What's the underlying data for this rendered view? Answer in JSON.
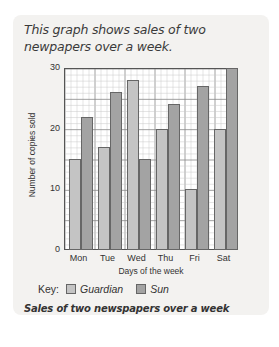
{
  "intro_text": "This graph shows sales of two newpapers over a week.",
  "caption": "Sales of two newspapers over a week",
  "key": {
    "label": "Key:",
    "items": [
      {
        "name": "Guardian",
        "color": "#c4c4c4"
      },
      {
        "name": "Sun",
        "color": "#a3a3a3"
      }
    ]
  },
  "chart_data": {
    "type": "bar",
    "title": "Sales of two newspapers over a week",
    "xlabel": "Days of the week",
    "ylabel": "Number of copies sold",
    "categories": [
      "Mon",
      "Tue",
      "Wed",
      "Thu",
      "Fri",
      "Sat"
    ],
    "series": [
      {
        "name": "Guardian",
        "values": [
          15,
          17,
          28,
          20,
          10,
          20
        ],
        "color": "#c4c4c4"
      },
      {
        "name": "Sun",
        "values": [
          22,
          26,
          15,
          24,
          27,
          30
        ],
        "color": "#a3a3a3"
      }
    ],
    "ylim": [
      0,
      30
    ],
    "yticks": [
      0,
      10,
      20,
      30
    ],
    "grid": true,
    "legend_position": "bottom"
  }
}
